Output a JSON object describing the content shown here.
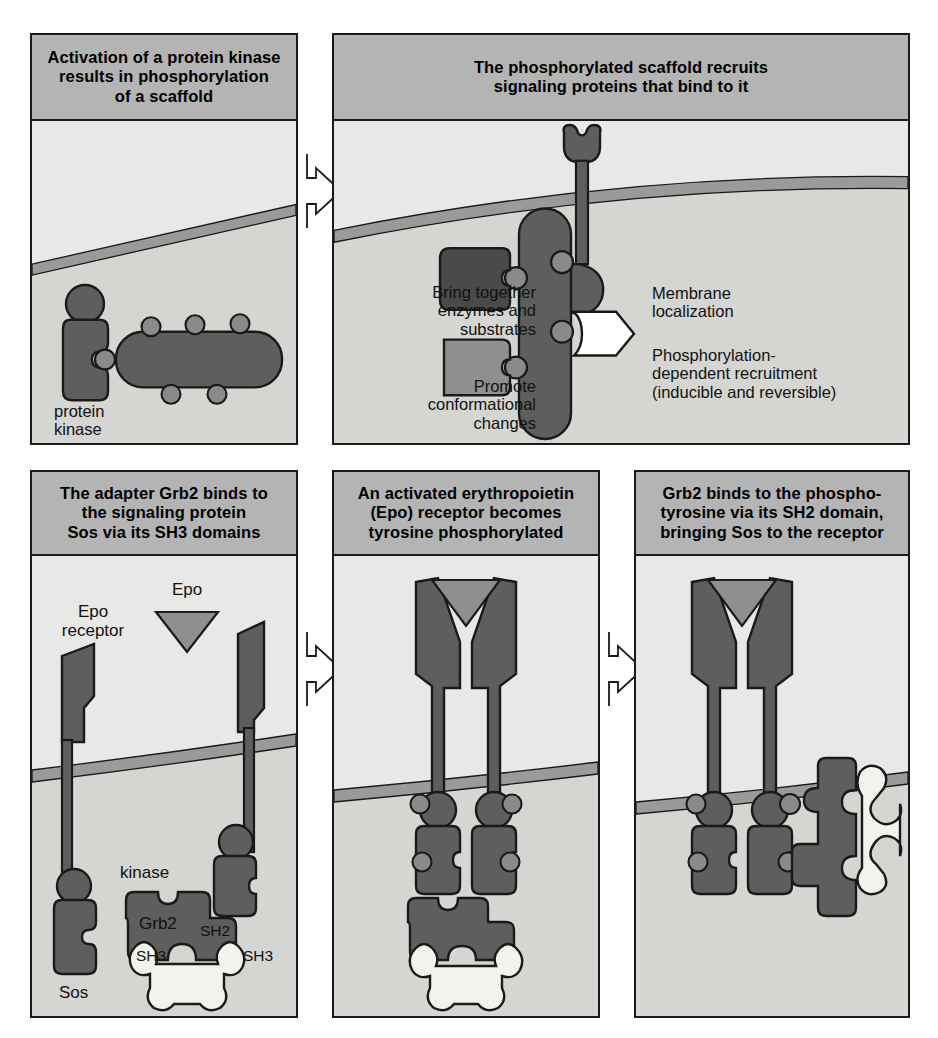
{
  "figure": {
    "background": "#ffffff",
    "panel_fill": "#e8e8e6",
    "panel_header_fill": "#b4b4b4",
    "protein_dark": "#5e5e5e",
    "protein_mid": "#8a8a8a",
    "protein_light": "#f2f2ef",
    "membrane_fill": "#9a9a9a",
    "cytoplasm_fill": "#d5d5d2",
    "outline": "#1a1a1a"
  },
  "panels": [
    {
      "id": "panel-1",
      "title": "Activation of a protein kinase\nresults in phosphorylation\nof a scaffold",
      "labels": [
        {
          "name": "protein-kinase-label",
          "text": "protein\nkinase"
        }
      ]
    },
    {
      "id": "panel-2",
      "title": "The phosphorylated scaffold recruits\nsignaling proteins that bind to it",
      "labels": [
        {
          "name": "bring-together-label",
          "text": "Bring together\nenzymes and\nsubstrates"
        },
        {
          "name": "promote-conformational-label",
          "text": "Promote\nconformational\nchanges"
        },
        {
          "name": "membrane-localization-label",
          "text": "Membrane\nlocalization"
        },
        {
          "name": "phosphorylation-dependent-label",
          "text": "Phosphorylation-\ndependent recruitment\n(inducible and reversible)"
        }
      ]
    },
    {
      "id": "panel-3",
      "title": "The adapter Grb2 binds to\nthe signaling protein\nSos via its SH3 domains",
      "labels": [
        {
          "name": "epo-label",
          "text": "Epo"
        },
        {
          "name": "epo-receptor-label",
          "text": "Epo\nreceptor"
        },
        {
          "name": "kinase-label",
          "text": "kinase"
        },
        {
          "name": "grb2-label",
          "text": "Grb2"
        },
        {
          "name": "sh2-label",
          "text": "SH2"
        },
        {
          "name": "sh3-left-label",
          "text": "SH3"
        },
        {
          "name": "sh3-right-label",
          "text": "SH3"
        },
        {
          "name": "sos-label",
          "text": "Sos"
        }
      ]
    },
    {
      "id": "panel-4",
      "title": "An activated erythropoietin\n(Epo) receptor becomes\ntyrosine phosphorylated",
      "labels": []
    },
    {
      "id": "panel-5",
      "title": "Grb2 binds to the phospho-\ntyrosine via its SH2 domain,\nbringing Sos to the receptor",
      "labels": []
    }
  ],
  "connectors": [
    {
      "name": "arrow-panel1-to-panel2",
      "direction": "right"
    },
    {
      "name": "arrow-panel3-to-panel4",
      "direction": "right"
    },
    {
      "name": "arrow-panel4-to-panel5",
      "direction": "right"
    }
  ]
}
